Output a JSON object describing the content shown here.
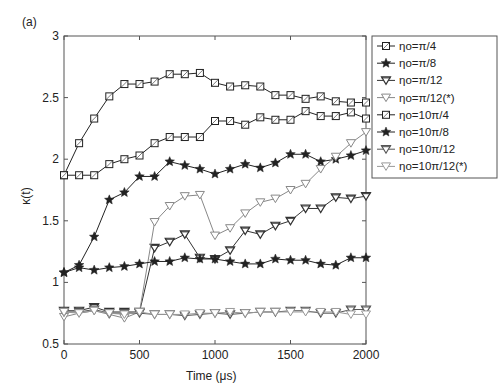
{
  "panel_label": "(a)",
  "chart_data": {
    "type": "line",
    "title": "",
    "xlabel": "Time (μs)",
    "ylabel": "κ(t)",
    "xlim": [
      0,
      2000
    ],
    "ylim": [
      0.5,
      3
    ],
    "xticks": [
      0,
      500,
      1000,
      1500,
      2000
    ],
    "xtick_labels": [
      "0",
      "500",
      "1000",
      "1500",
      "2000"
    ],
    "yticks": [
      0.5,
      1,
      1.5,
      2,
      2.5,
      3
    ],
    "ytick_labels": [
      "0.5",
      "1",
      "1.5",
      "2",
      "2.5",
      "3"
    ],
    "grid": false,
    "legend_position": "outside-right-top",
    "x": [
      0,
      100,
      200,
      300,
      400,
      500,
      600,
      700,
      800,
      900,
      1000,
      1100,
      1200,
      1300,
      1400,
      1500,
      1600,
      1700,
      1800,
      1900,
      2000
    ],
    "series": [
      {
        "name": "ηo=π/4",
        "marker": "square",
        "color": "#222222",
        "values": [
          1.87,
          2.13,
          2.33,
          2.51,
          2.61,
          2.61,
          2.63,
          2.69,
          2.69,
          2.7,
          2.62,
          2.59,
          2.6,
          2.59,
          2.52,
          2.52,
          2.49,
          2.51,
          2.47,
          2.46,
          2.46
        ]
      },
      {
        "name": "ηo=π/8",
        "marker": "star",
        "color": "#222222",
        "values": [
          1.08,
          1.14,
          1.37,
          1.67,
          1.73,
          1.86,
          1.86,
          1.98,
          1.95,
          1.92,
          1.88,
          1.92,
          1.96,
          1.93,
          1.97,
          2.04,
          2.04,
          1.98,
          2.0,
          2.03,
          2.07
        ]
      },
      {
        "name": "ηo=π/12",
        "marker": "triangle-down",
        "color": "#333333",
        "values": [
          0.77,
          0.77,
          0.8,
          0.76,
          0.76,
          0.76,
          1.28,
          1.33,
          1.39,
          1.2,
          1.19,
          1.26,
          1.42,
          1.39,
          1.46,
          1.5,
          1.6,
          1.6,
          1.69,
          1.68,
          1.7
        ]
      },
      {
        "name": "ηo=π/12(*)",
        "marker": "triangle-down-open",
        "color": "#888888",
        "values": [
          0.72,
          0.75,
          0.77,
          0.74,
          0.71,
          0.76,
          1.49,
          1.62,
          1.7,
          1.71,
          1.38,
          1.44,
          1.56,
          1.65,
          1.68,
          1.75,
          1.8,
          1.92,
          2.02,
          2.13,
          2.22
        ]
      },
      {
        "name": "ηo=10π/4",
        "marker": "square",
        "color": "#222222",
        "values": [
          1.87,
          1.87,
          1.87,
          1.96,
          2.0,
          2.03,
          2.13,
          2.18,
          2.18,
          2.18,
          2.31,
          2.31,
          2.28,
          2.34,
          2.32,
          2.32,
          2.39,
          2.35,
          2.35,
          2.38,
          2.33
        ]
      },
      {
        "name": "ηo=10π/8",
        "marker": "star",
        "color": "#222222",
        "values": [
          1.08,
          1.12,
          1.1,
          1.12,
          1.13,
          1.15,
          1.17,
          1.17,
          1.2,
          1.19,
          1.19,
          1.17,
          1.15,
          1.15,
          1.19,
          1.18,
          1.18,
          1.15,
          1.14,
          1.2,
          1.2
        ]
      },
      {
        "name": "ηo=10π/12",
        "marker": "triangle-down",
        "color": "#555555",
        "values": [
          0.76,
          0.76,
          0.78,
          0.75,
          0.75,
          0.75,
          0.74,
          0.74,
          0.73,
          0.74,
          0.75,
          0.74,
          0.75,
          0.76,
          0.76,
          0.77,
          0.77,
          0.75,
          0.75,
          0.78,
          0.78
        ]
      },
      {
        "name": "ηo=10π/12(*)",
        "marker": "triangle-down-open",
        "color": "#999999",
        "values": [
          0.76,
          0.75,
          0.77,
          0.75,
          0.74,
          0.76,
          0.74,
          0.74,
          0.74,
          0.75,
          0.75,
          0.76,
          0.75,
          0.76,
          0.76,
          0.76,
          0.76,
          0.76,
          0.76,
          0.74,
          0.74
        ]
      }
    ]
  }
}
